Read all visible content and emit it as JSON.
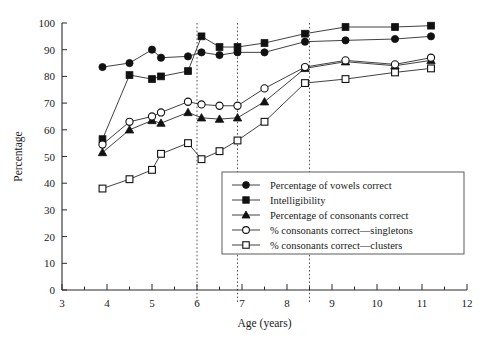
{
  "chart_data": {
    "type": "line",
    "title": "",
    "xlabel": "Age (years)",
    "ylabel": "Percentage",
    "xlim": [
      3,
      12
    ],
    "ylim": [
      0,
      100
    ],
    "xticks": [
      3,
      4,
      5,
      6,
      7,
      8,
      9,
      10,
      11,
      12
    ],
    "yticks": [
      0,
      10,
      20,
      30,
      40,
      50,
      60,
      70,
      80,
      90,
      100
    ],
    "xminor_step": 0.5,
    "grid": false,
    "legend_position": "center-right",
    "reference_lines": [
      6,
      6.9,
      8.5
    ],
    "series": [
      {
        "name": "Percentage of vowels correct",
        "marker": "filled-circle",
        "x": [
          3.9,
          4.5,
          5.0,
          5.2,
          5.8,
          6.1,
          6.5,
          6.9,
          7.5,
          8.4,
          9.3,
          10.4,
          11.2
        ],
        "values": [
          83.5,
          85.0,
          90.0,
          87.0,
          87.5,
          89.0,
          88.0,
          89.0,
          89.0,
          93.0,
          93.5,
          94.0,
          95.0
        ]
      },
      {
        "name": "Intelligibility",
        "marker": "filled-square",
        "x": [
          3.9,
          4.5,
          5.0,
          5.2,
          5.8,
          6.1,
          6.5,
          6.9,
          7.5,
          8.4,
          9.3,
          10.4,
          11.2
        ],
        "values": [
          56.5,
          80.5,
          79.0,
          80.0,
          82.0,
          95.0,
          91.0,
          91.0,
          92.5,
          96.0,
          98.5,
          98.5,
          99.0
        ]
      },
      {
        "name": "Percentage of consonants correct",
        "marker": "filled-triangle",
        "x": [
          3.9,
          4.5,
          5.0,
          5.2,
          5.8,
          6.1,
          6.5,
          6.9,
          7.5,
          8.4,
          9.3,
          10.4,
          11.2
        ],
        "values": [
          51.5,
          60.0,
          63.5,
          62.5,
          66.5,
          64.5,
          64.0,
          64.5,
          70.5,
          83.0,
          85.5,
          84.0,
          86.0
        ]
      },
      {
        "name": "% consonants correct—singletons",
        "marker": "open-circle",
        "x": [
          3.9,
          4.5,
          5.0,
          5.2,
          5.8,
          6.1,
          6.5,
          6.9,
          7.5,
          8.4,
          9.3,
          10.4,
          11.2
        ],
        "values": [
          54.5,
          63.0,
          65.0,
          66.5,
          70.5,
          69.5,
          69.0,
          69.0,
          75.5,
          83.5,
          86.0,
          84.5,
          87.0
        ]
      },
      {
        "name": "% consonants correct—clusters",
        "marker": "open-square",
        "x": [
          3.9,
          4.5,
          5.0,
          5.2,
          5.8,
          6.1,
          6.5,
          6.9,
          7.5,
          8.4,
          9.3,
          10.4,
          11.2
        ],
        "values": [
          38.0,
          41.5,
          45.0,
          51.0,
          55.0,
          49.0,
          52.0,
          56.0,
          63.0,
          77.5,
          79.0,
          81.5,
          83.0
        ]
      }
    ]
  },
  "legend": {
    "items": [
      {
        "label": "Percentage of vowels correct",
        "marker": "filled-circle"
      },
      {
        "label": "Intelligibility",
        "marker": "filled-square"
      },
      {
        "label": "Percentage of consonants correct",
        "marker": "filled-triangle"
      },
      {
        "label": "% consonants correct—singletons",
        "marker": "open-circle"
      },
      {
        "label": "% consonants correct—clusters",
        "marker": "open-square"
      }
    ]
  },
  "colors": {
    "axis": "#2b2b2b",
    "marker_fill": "#111111",
    "marker_open": "#ffffff",
    "reference_line": "#555555",
    "background": "#ffffff"
  }
}
